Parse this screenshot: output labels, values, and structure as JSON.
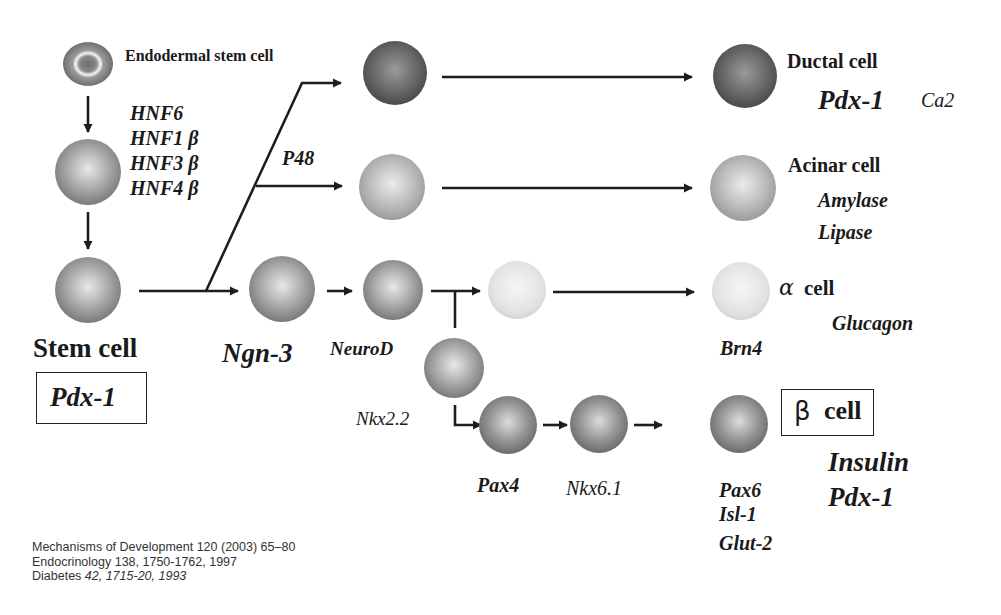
{
  "diagram": {
    "nodes": {
      "endodermal": {
        "label": "Endodermal stem cell"
      },
      "hnf_factors": [
        "HNF6",
        "HNF1 β",
        "HNF3 β",
        "HNF4 β"
      ],
      "stem": {
        "label": "Stem cell",
        "marker": "Pdx-1"
      },
      "p48": {
        "label": "P48"
      },
      "ngn3": {
        "label": "Ngn-3"
      },
      "neurod": {
        "label": "NeuroD"
      },
      "nkx22": {
        "label": "Nkx2.2"
      },
      "ductal": {
        "label": "Ductal cell",
        "markers": [
          "Pdx-1",
          "Ca2"
        ]
      },
      "acinar": {
        "label": "Acinar cell",
        "markers": [
          "Amylase",
          "Lipase"
        ]
      },
      "alpha": {
        "symbol": "α",
        "label": "cell",
        "factor": "Brn4",
        "markers": [
          "Glucagon"
        ]
      },
      "pax4": {
        "label": "Pax4"
      },
      "nkx61": {
        "label": "Nkx6.1"
      },
      "pax6_group": [
        "Pax6",
        "Isl-1",
        "Glut-2"
      ],
      "beta": {
        "symbol": "β",
        "label": "cell",
        "markers": [
          "Insulin",
          "Pdx-1"
        ]
      }
    },
    "colors": {
      "arrow": "#1e1e1e",
      "cell_dark": "#5a5a5a",
      "cell_medium": "#8a8a8a",
      "cell_light": "#b8b8b8",
      "cell_pale": "#dcdcdc"
    }
  },
  "references": [
    "Mechanisms of Development 120 (2003) 65–80",
    "Endocrinology 138, 1750-1762, 1997",
    {
      "journal": "Diabetes ",
      "detail": "42, 1715-20, 1993"
    }
  ]
}
